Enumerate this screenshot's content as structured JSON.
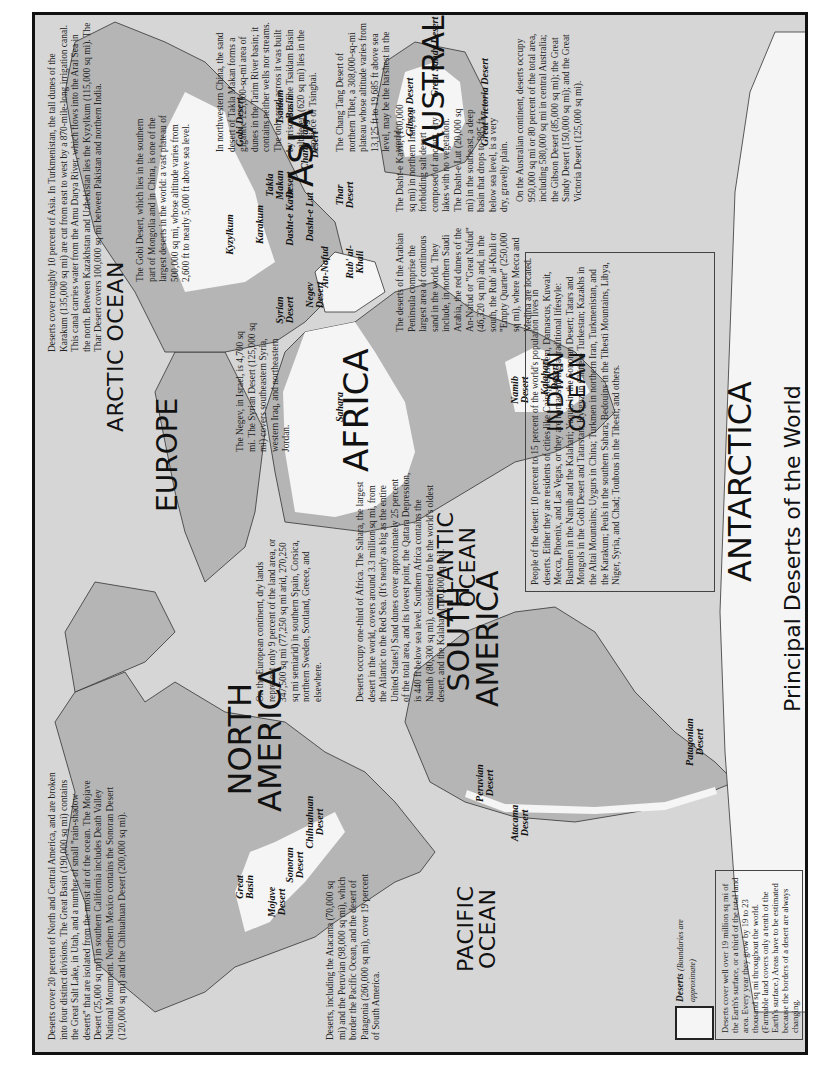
{
  "title": "Principal Deserts of the World",
  "colors": {
    "background": "#d6d6d6",
    "land": "#b5b5b5",
    "desert": "#f5f5f5",
    "border": "#111111",
    "text": "#222222"
  },
  "oceans": {
    "arctic": "ARCTIC OCEAN",
    "pacific_1": "PACIFIC",
    "pacific_2": "OCEAN",
    "atlantic_1": "ATLANTIC",
    "atlantic_2": "OCEAN",
    "indian_1": "INDIAN",
    "indian_2": "OCEAN"
  },
  "continents": {
    "north_america_1": "NORTH",
    "north_america_2": "AMERICA",
    "south_america_1": "SOUTH",
    "south_america_2": "AMERICA",
    "europe": "EUROPE",
    "africa": "AFRICA",
    "asia": "ASIA",
    "australia": "AUSTRALIA",
    "antarctica": "ANTARCTICA"
  },
  "deserts": {
    "great_basin": "Great Basin",
    "mojave": "Mojave Desert",
    "sonoran": "Sonoran Desert",
    "chihuahuan": "Chihuahuan Desert",
    "peruvian": "Peruvian Desert",
    "atacama": "Atacama Desert",
    "patagonian": "Patagonian Desert",
    "sahara": "Sahara",
    "namib": "Namib Desert",
    "kalahari": "Kalahari Desert",
    "syrian": "Syrian Desert",
    "negev": "Negev Desert",
    "an_nafud": "An-Nafud",
    "rub_al_khali": "Rub' al-Khali",
    "kyzylkum": "Kyzylkum",
    "karakum": "Karakum",
    "dasht_e_kavir": "Dasht-e Kavir",
    "dasht_e_lut": "Dasht-e Lut",
    "thar": "Thar Desert",
    "takla_makan": "Takla Makan Desert",
    "gobi": "Gobi Desert",
    "tsaidam": "Tsaidam Basin",
    "chang_tang": "Chang Tang Desert",
    "great_sandy": "Great Sandy Desert",
    "gibson": "Gibson Desert",
    "great_victoria": "Great Victoria Desert"
  },
  "legend": {
    "label": "Deserts",
    "note": "(Boundaries are approximate)",
    "text": "Deserts cover well over 19 million sq mi of the Earth's surface, or a third of the total land area. Every year they grow by 19 to 23 thousand sq mi throughout the world. (Farmable land covers only a tenth of the Earth's surface.) Areas have to be estimated because the borders of a desert are always changing."
  },
  "notes": {
    "north_america": "Deserts cover 20 percent of North and Central America, and are broken into four distinct divisions. The Great Basin (190,000 sq mi) contains the Great Salt Lake, in Utah, and a number of small \"rain-shadow deserts\" that are isolated from the moist air of the ocean. The Mojave Desert (25,000 sq mi) in southern California includes Death Valley National Monument. Northern Mexico contains the Sonoran Desert (120,000 sq mi) and the Chihuahuan Desert (200,000 sq mi).",
    "south_america": "Deserts, including the Atacama (70,000 sq mi) and the Peruvian (98,000 sq mi), which border the Pacific Ocean, and the desert of Patagonia (260,000 sq mi), cover 19 percent of South America.",
    "europe": "On the European continent, dry lands represent only 9 percent of the land area, or 347,500 sq mi (77,250 sq mi arid, 270,250 sq mi semiarid) in southern Spain, Corsica, northern Sweden, Scotland, Greece, and elsewhere.",
    "africa": "Deserts occupy one-third of Africa. The Sahara, the largest desert in the world, covers around 3.3 million sq mi, from the Atlantic to the Red Sea. (It's nearly as big as the entire United States!) Sand dunes cover approximately 25 percent of the total area, and its lowest point, the Qattara Depression, is 440 ft below sea level. Southern Africa contains the Namib (80,300 sq mi), considered to be the world's oldest desert, and the Kalahari (100,000 sq mi).",
    "negev_syria": "The Negev, in Israel, is 4,700 sq mi. The Syrian Desert (125,000 sq mi) covers southeastern Syria, western Iraq, and northeastern Jordan.",
    "arabia": "The deserts of the Arabian Peninsula comprise the largest area of continuous sand in the world. They include, in northern Saudi Arabia, the red dunes of the An-Nafud or \"Great Nafud\" (46,320 sq mi) and, in the south, the Rub' al-Khali or \"Empty Quarter\" (250,000 sq mi), where Mecca and Medina are located.",
    "iran": "The Dasht-e Kavir, (100,000 sq mi) in northern Iran, is a forbidding salt desert composed of ancient, dry lakes with no vegetation. The Dasht-e Lut (20,000 sq mi) in the southeast, a deep basin that drops to 985 ft below sea level, is a very dry, gravelly plain.",
    "gobi": "The Gobi Desert, which lies in the southern part of Mongolia and in China, is one of the largest deserts in the world: a vast plateau of 500,000 sq mi, whose altitude varies from 2,600 ft to nearly 5,000 ft above sea level.",
    "central_asia": "Deserts cover roughly 10 percent of Asia. In Turkmenistan, the tall dunes of the Karakum (135,000 sq mi) are cut from east to west by a 870-mile-long irrigation canal. This canal carries water from the Amu Darya River, which flows into the Aral Sea in the north. Between Kazakhstan and Uzbekistan lies the Kyzylkum (115,000 sq mi). The Thar Desert covers 100,000 sq mi between Pakistan and northern India.",
    "takla_makan": "In northwestern China, the sand desert of Takla Makan forms a gigantic 125,000-sq-mi area of dunes in the Tarim River basin; it contains neither wells nor streams. The only road across it was built by prisoners. The Tsaidam Basin salt desert (620 sq mi) lies in the province of Tsinghai.",
    "chang_tang": "The Chang Tang Desert of northern Tibet, a 308,000-sq-mi plateau whose altitude varies from 13,125 ft to 19,685 ft above sea level, may be the harshest in the world.",
    "australia": "On the Australian continent, deserts occupy 950,000 sq mi or 80 percent of the total area, including 580,000 sq mi in central Australia; the Gibson Desert (85,000 sq mi); the Great Sandy Desert (150,000 sq mi); and the Great Victoria Desert (125,000 sq mi).",
    "people": "People of the desert: 10 percent to 15 percent of the world's population lives in deserts. Either they are residents of cities like Cairo, Jerusalem, Damascus, Kuwait, Mecca, Phoenix, and Las Vegas, or they are nomads living a traditional lifestyle: Bushmen in the Namib and the Kalahari; Yaquis in the Sonoran Desert; Tatars and Mongols in the Gobi Desert and Tatarstan; Kyrgyz in Chinese Turkestan; Kazakhs in the Altai Mountains; Uygurs in China; Turkmen in northern Iran, Turkmenistan, and the Karakum; Peuls in the southern Sahara; Bedouins in the Tibesti Mountains, Libya, Niger, Syria, and Chad; Toubous in the Tibesti; and others."
  }
}
